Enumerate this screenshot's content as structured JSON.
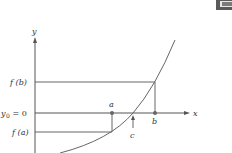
{
  "diagram": {
    "type": "intermediate-value-theorem",
    "axes": {
      "x_label": "x",
      "y_label": "y"
    },
    "y_labels": {
      "f_b": "f (b)",
      "y0_prefix": "y",
      "y0_sub": "0",
      "y0_suffix": " = 0",
      "f_a": "f (a)"
    },
    "x_points": {
      "a": "a",
      "b": "b",
      "c": "c"
    },
    "colors": {
      "line": "#555555",
      "text": "#333333",
      "corner_box": "#555555"
    }
  }
}
